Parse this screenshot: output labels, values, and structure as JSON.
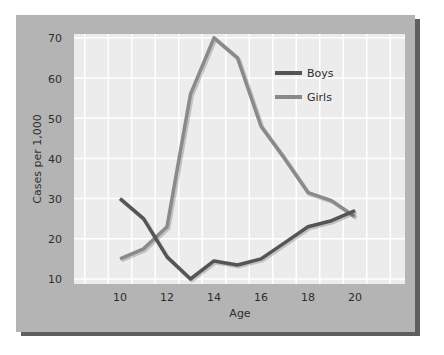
{
  "chart_data": {
    "type": "line",
    "title": "",
    "xlabel": "Age",
    "ylabel": "Cases per 1,000",
    "x": [
      10,
      11,
      12,
      13,
      14,
      15,
      16,
      17,
      18,
      19,
      20
    ],
    "x_ticks": [
      "10",
      "12",
      "14",
      "16",
      "18",
      "20"
    ],
    "y_ticks": [
      "10",
      "20",
      "30",
      "40",
      "50",
      "60",
      "70"
    ],
    "xlim": [
      8,
      22
    ],
    "ylim": [
      9,
      71
    ],
    "grid": true,
    "legend_position": "upper right",
    "series": [
      {
        "name": "Boys",
        "color": "#555459",
        "values": [
          30,
          25,
          15.5,
          10,
          14.5,
          13.5,
          15,
          19,
          23,
          24.5,
          27
        ]
      },
      {
        "name": "Girls",
        "color": "#8a8a8e",
        "values": [
          15,
          17.5,
          23,
          56,
          70,
          65,
          48,
          40,
          31.5,
          29.5,
          25.5
        ]
      }
    ]
  },
  "legend": {
    "boys": "Boys",
    "girls": "Girls"
  },
  "axes": {
    "xlabel": "Age",
    "ylabel": "Cases per 1,000",
    "x_tick_labels": {
      "t10": "10",
      "t12": "12",
      "t14": "14",
      "t16": "16",
      "t18": "18",
      "t20": "20"
    },
    "y_tick_labels": {
      "t10": "10",
      "t20": "20",
      "t30": "30",
      "t40": "40",
      "t50": "50",
      "t60": "60",
      "t70": "70"
    }
  },
  "colors": {
    "panel": "#b4b4b4",
    "panel_shadow": "#5f5f5f",
    "plot_bg": "#ececed",
    "grid": "#ffffff",
    "boys": "#555459",
    "girls": "#8a8a8e"
  }
}
